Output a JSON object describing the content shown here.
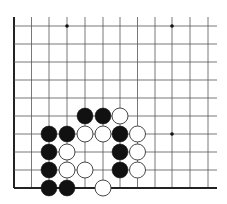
{
  "board": {
    "title": "Go problem diagram (corner, lower-left)",
    "grid": {
      "columns_x": [
        14,
        31.5,
        49,
        67,
        85,
        103,
        120,
        137.5,
        155,
        172,
        190,
        208
      ],
      "rows_y": [
        26,
        44,
        62,
        80,
        98,
        116,
        134,
        152,
        170,
        188
      ],
      "top_open_y": 17,
      "right_open_x": 217,
      "edge_left": true,
      "edge_bottom": true,
      "line_color": "#555555",
      "edge_color": "#222222"
    },
    "star_points": [
      {
        "col": 3,
        "row": 0
      },
      {
        "col": 9,
        "row": 0
      },
      {
        "col": 9,
        "row": 6
      }
    ],
    "stone_radius": 8,
    "colors": {
      "black": "#111111",
      "white": "#ffffff",
      "white_outline": "#333333"
    },
    "stones": [
      {
        "color": "black",
        "col": 4,
        "row": 5
      },
      {
        "color": "black",
        "col": 5,
        "row": 5
      },
      {
        "color": "white",
        "col": 6,
        "row": 5
      },
      {
        "color": "black",
        "col": 2,
        "row": 6
      },
      {
        "color": "black",
        "col": 3,
        "row": 6
      },
      {
        "color": "white",
        "col": 4,
        "row": 6
      },
      {
        "color": "white",
        "col": 5,
        "row": 6
      },
      {
        "color": "black",
        "col": 6,
        "row": 6
      },
      {
        "color": "white",
        "col": 7,
        "row": 6
      },
      {
        "color": "black",
        "col": 2,
        "row": 7
      },
      {
        "color": "white",
        "col": 3,
        "row": 7
      },
      {
        "color": "black",
        "col": 6,
        "row": 7
      },
      {
        "color": "white",
        "col": 7,
        "row": 7
      },
      {
        "color": "black",
        "col": 2,
        "row": 8
      },
      {
        "color": "white",
        "col": 3,
        "row": 8
      },
      {
        "color": "white",
        "col": 4,
        "row": 8
      },
      {
        "color": "black",
        "col": 6,
        "row": 8
      },
      {
        "color": "white",
        "col": 7,
        "row": 8
      },
      {
        "color": "black",
        "col": 2,
        "row": 9
      },
      {
        "color": "black",
        "col": 3,
        "row": 9
      },
      {
        "color": "white",
        "col": 5,
        "row": 9
      }
    ]
  }
}
